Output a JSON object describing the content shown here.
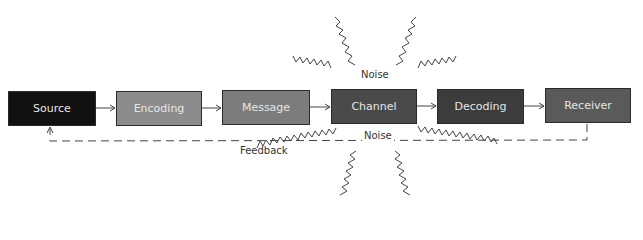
{
  "diagram": {
    "type": "communication-process-model",
    "nodes": [
      {
        "id": "source",
        "label": "Source",
        "color": "#111111"
      },
      {
        "id": "encoding",
        "label": "Encoding",
        "color": "#8c8c8c"
      },
      {
        "id": "message",
        "label": "Message",
        "color": "#7c7c7c"
      },
      {
        "id": "channel",
        "label": "Channel",
        "color": "#4a4a4a"
      },
      {
        "id": "decoding",
        "label": "Decoding",
        "color": "#3c3c3c"
      },
      {
        "id": "receiver",
        "label": "Receiver",
        "color": "#5a5a5a"
      }
    ],
    "edges": [
      {
        "from": "Source",
        "to": "Encoding"
      },
      {
        "from": "Encoding",
        "to": "Message"
      },
      {
        "from": "Message",
        "to": "Channel"
      },
      {
        "from": "Channel",
        "to": "Decoding"
      },
      {
        "from": "Decoding",
        "to": "Receiver"
      },
      {
        "from": "Receiver",
        "to": "Source",
        "style": "dashed",
        "label": "Feedback"
      }
    ],
    "noise_top_label": "Noise",
    "noise_bottom_label": "Noise",
    "feedback_label": "Feedback"
  }
}
